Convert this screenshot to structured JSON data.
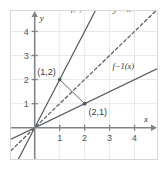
{
  "figure": {
    "kind": "cartesian-plot",
    "border_color": "#d8d8d8",
    "background": "#ffffff",
    "ink_color": "#55595d",
    "axis_color": "#808488",
    "grid_color": "#e9e9e9"
  },
  "axes": {
    "x_name": "x",
    "y_name": "y",
    "x_ticks": [
      "1",
      "2",
      "3",
      "4"
    ],
    "y_ticks": [
      "1",
      "2",
      "3",
      "4"
    ],
    "xlim": [
      -0.95,
      4.9
    ],
    "ylim": [
      -1.3,
      4.85
    ],
    "grid": true
  },
  "labels": {
    "f": "f(x)",
    "f_inverse": "f−1(x)",
    "identity": "y = x"
  },
  "points": [
    {
      "label": "(1,2)",
      "x": 1,
      "y": 2
    },
    {
      "label": "(2,1)",
      "x": 2,
      "y": 1
    }
  ],
  "chart_data": {
    "type": "line",
    "title": "",
    "xlabel": "x",
    "ylabel": "y",
    "xlim": [
      -0.95,
      4.9
    ],
    "ylim": [
      -1.3,
      4.85
    ],
    "xticks": [
      1,
      2,
      3,
      4
    ],
    "yticks": [
      1,
      2,
      3,
      4
    ],
    "grid": true,
    "legend": "inline-curve-labels",
    "series": [
      {
        "name": "f(x)",
        "style": "solid",
        "slope": 2,
        "intercept": 0,
        "points_through": [
          [
            0,
            0
          ],
          [
            1,
            2
          ]
        ],
        "label_text": "f(x)",
        "label_at": [
          1.45,
          4.85
        ]
      },
      {
        "name": "y = x",
        "style": "dashed",
        "slope": 1,
        "intercept": 0,
        "points_through": [
          [
            0,
            0
          ],
          [
            1,
            1
          ]
        ],
        "label_text": "y = x",
        "label_at": [
          3.15,
          4.8
        ]
      },
      {
        "name": "f−1(x)",
        "style": "solid",
        "slope": 0.5,
        "intercept": 0,
        "points_through": [
          [
            0,
            0
          ],
          [
            2,
            1
          ]
        ],
        "label_text": "f−1(x)",
        "label_at": [
          3.55,
          2.45
        ]
      },
      {
        "name": "reflection-segment",
        "style": "solid",
        "points_through": [
          [
            1,
            2
          ],
          [
            2,
            1
          ]
        ],
        "label_text": ""
      }
    ],
    "annotations": [
      {
        "text": "(1,2)",
        "x": 1,
        "y": 2,
        "marker": true
      },
      {
        "text": "(2,1)",
        "x": 2,
        "y": 1,
        "marker": true
      }
    ]
  }
}
